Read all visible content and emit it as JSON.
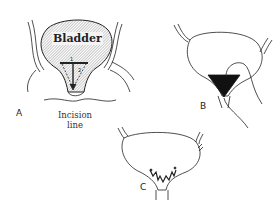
{
  "figure": {
    "panels": [
      {
        "id": "A",
        "label": "A",
        "organ_label": "Bladder",
        "annotation": "Incision line",
        "annotation_lines": [
          "Incision",
          "line"
        ],
        "step_numbers": [
          "1",
          "2"
        ]
      },
      {
        "id": "B",
        "label": "B"
      },
      {
        "id": "C",
        "label": "C"
      }
    ]
  },
  "colors": {
    "ink": "#222222",
    "hatch": "#888888",
    "fill_dark": "#111111"
  }
}
